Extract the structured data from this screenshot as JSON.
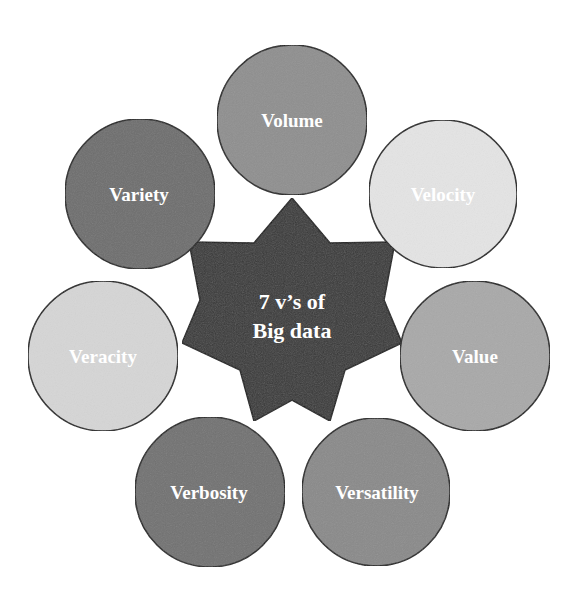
{
  "diagram": {
    "center": {
      "line1": "7 v’s of",
      "line2": "Big data",
      "fill": "#3a3a3a"
    },
    "nodes": [
      {
        "label": "Volume",
        "fill": "#8f8f8f",
        "cx": 292,
        "cy": 120
      },
      {
        "label": "Velocity",
        "fill": "#e4e4e4",
        "cx": 443,
        "cy": 194
      },
      {
        "label": "Value",
        "fill": "#a9a9a9",
        "cx": 475,
        "cy": 356
      },
      {
        "label": "Versatility",
        "fill": "#8a8a8a",
        "cx": 376,
        "cy": 492
      },
      {
        "label": "Verbosity",
        "fill": "#727272",
        "cx": 210,
        "cy": 492
      },
      {
        "label": "Veracity",
        "fill": "#d6d6d6",
        "cx": 103,
        "cy": 356
      },
      {
        "label": "Variety",
        "fill": "#6e6e6e",
        "cx": 140,
        "cy": 194
      }
    ]
  }
}
